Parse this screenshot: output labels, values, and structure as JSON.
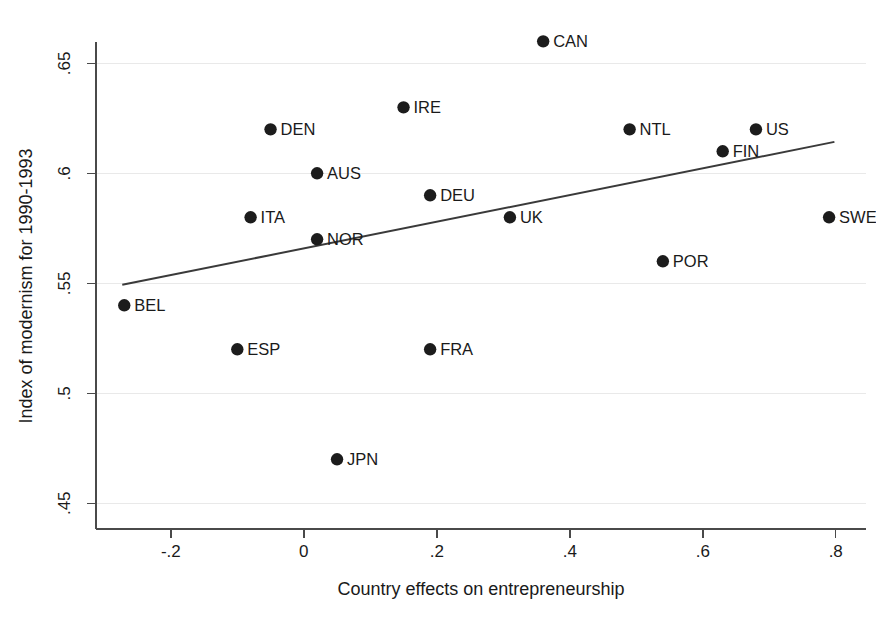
{
  "chart_data": {
    "type": "scatter",
    "title": "",
    "xlabel": "Country effects on entrepreneurship",
    "ylabel": "Index of modernism for 1990-1993",
    "xlim": [
      -0.3125,
      0.8455
    ],
    "ylim": [
      0.4383,
      0.6597
    ],
    "grid": true,
    "legend": "none",
    "xticks": [
      -0.2,
      0,
      0.2,
      0.4,
      0.6,
      0.8
    ],
    "xticklabels": [
      "-.2",
      "0",
      ".2",
      ".4",
      ".6",
      ".8"
    ],
    "yticks": [
      0.45,
      0.5,
      0.55,
      0.6,
      0.65
    ],
    "yticklabels": [
      ".45",
      ".5",
      ".55",
      ".6",
      ".65"
    ],
    "point_label_position": "right",
    "points": [
      {
        "label": "CAN",
        "x": 0.36,
        "y": 0.66
      },
      {
        "label": "IRE",
        "x": 0.15,
        "y": 0.63
      },
      {
        "label": "DEN",
        "x": -0.05,
        "y": 0.62
      },
      {
        "label": "NTL",
        "x": 0.49,
        "y": 0.62
      },
      {
        "label": "US",
        "x": 0.68,
        "y": 0.62
      },
      {
        "label": "FIN",
        "x": 0.63,
        "y": 0.61
      },
      {
        "label": "AUS",
        "x": 0.02,
        "y": 0.6
      },
      {
        "label": "DEU",
        "x": 0.19,
        "y": 0.59
      },
      {
        "label": "ITA",
        "x": -0.08,
        "y": 0.58
      },
      {
        "label": "UK",
        "x": 0.31,
        "y": 0.58
      },
      {
        "label": "SWE",
        "x": 0.79,
        "y": 0.58
      },
      {
        "label": "NOR",
        "x": 0.02,
        "y": 0.57
      },
      {
        "label": "POR",
        "x": 0.54,
        "y": 0.56
      },
      {
        "label": "BEL",
        "x": -0.27,
        "y": 0.54
      },
      {
        "label": "ESP",
        "x": -0.1,
        "y": 0.52
      },
      {
        "label": "FRA",
        "x": 0.19,
        "y": 0.52
      },
      {
        "label": "JPN",
        "x": 0.05,
        "y": 0.47
      }
    ],
    "fit_line": {
      "name": "linear fit",
      "x0": -0.273,
      "y0": 0.5493,
      "x1": 0.798,
      "y1": 0.6143
    }
  }
}
